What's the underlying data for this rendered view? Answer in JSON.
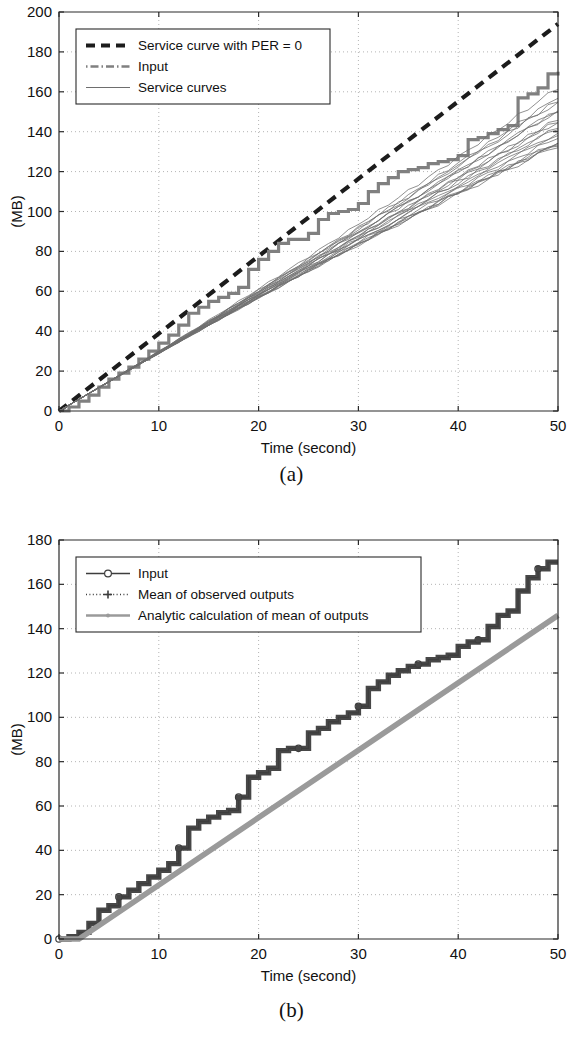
{
  "figure": {
    "caption_a": "(a)",
    "caption_b": "(b)"
  },
  "colors": {
    "axis": "#2a2a2a",
    "grid": "#b4b4b4",
    "service_curve_per0": "#1c1c1c",
    "input_gray": "#808080",
    "service_curves_bundle": "#6e6e6e",
    "input_dark": "#3d3d3d",
    "mean_observed": "#3d3d3d",
    "analytic_mean": "#9a9a9a",
    "background": "#ffffff"
  },
  "chart_data": [
    {
      "id": "panel-a",
      "type": "line",
      "title": "",
      "xlabel": "Time (second)",
      "ylabel": "(MB)",
      "xlim": [
        0,
        50
      ],
      "ylim": [
        0,
        200
      ],
      "xticks": [
        0,
        10,
        20,
        30,
        40,
        50
      ],
      "yticks": [
        0,
        20,
        40,
        60,
        80,
        100,
        120,
        140,
        160,
        180,
        200
      ],
      "grid": true,
      "legend_position": "top-left",
      "legend": [
        {
          "label": "Service curve with PER = 0",
          "style": "thick-dashed",
          "color": "#1c1c1c"
        },
        {
          "label": "Input",
          "style": "dash-dot",
          "color": "#808080"
        },
        {
          "label": "Service curves",
          "style": "thin-solid",
          "color": "#6e6e6e"
        }
      ],
      "series": [
        {
          "name": "Service curve with PER = 0",
          "style": "thick-dashed",
          "color": "#1c1c1c",
          "x": [
            0,
            50
          ],
          "y": [
            0,
            194
          ]
        },
        {
          "name": "Input",
          "style": "staircase",
          "color": "#808080",
          "x": [
            0,
            1,
            2,
            3,
            4,
            5,
            6,
            7,
            8,
            9,
            10,
            11,
            12,
            13,
            14,
            15,
            16,
            17,
            18,
            19,
            20,
            21,
            22,
            23,
            24,
            25,
            26,
            27,
            28,
            29,
            30,
            31,
            32,
            33,
            34,
            35,
            36,
            37,
            38,
            39,
            40,
            41,
            42,
            43,
            44,
            45,
            46,
            47,
            48,
            49,
            50
          ],
          "y": [
            0,
            2,
            5,
            8,
            12,
            16,
            19,
            22,
            26,
            30,
            34,
            38,
            43,
            49,
            52,
            55,
            57,
            59,
            62,
            71,
            76,
            80,
            84,
            86,
            86,
            89,
            96,
            99,
            100,
            101,
            104,
            110,
            114,
            117,
            120,
            121,
            122,
            124,
            125,
            126,
            128,
            136,
            137,
            139,
            141,
            143,
            157,
            159,
            162,
            169,
            170
          ]
        },
        {
          "name": "Service curves",
          "style": "thin-solid-bundle",
          "color": "#6e6e6e",
          "bundle_count": 20,
          "mean_slope": 2.95,
          "spread_at_end": 16,
          "x": [
            0,
            50
          ],
          "y_mean": [
            0,
            147
          ]
        }
      ]
    },
    {
      "id": "panel-b",
      "type": "line",
      "title": "",
      "xlabel": "Time (second)",
      "ylabel": "(MB)",
      "xlim": [
        0,
        50
      ],
      "ylim": [
        0,
        180
      ],
      "xticks": [
        0,
        10,
        20,
        30,
        40,
        50
      ],
      "yticks": [
        0,
        20,
        40,
        60,
        80,
        100,
        120,
        140,
        160,
        180
      ],
      "grid": true,
      "legend_position": "top-left",
      "legend": [
        {
          "label": "Input",
          "style": "line-circle",
          "color": "#3d3d3d"
        },
        {
          "label": "Mean of observed outputs",
          "style": "dotted-plus",
          "color": "#3d3d3d"
        },
        {
          "label": "Analytic calculation of mean of outputs",
          "style": "thick-solid",
          "color": "#9a9a9a"
        }
      ],
      "series": [
        {
          "name": "Input",
          "style": "staircase-markers",
          "color": "#3d3d3d",
          "marker": "circle",
          "marker_every": 6,
          "x": [
            0,
            1,
            2,
            3,
            4,
            5,
            6,
            7,
            8,
            9,
            10,
            11,
            12,
            13,
            14,
            15,
            16,
            17,
            18,
            19,
            20,
            21,
            22,
            23,
            24,
            25,
            26,
            27,
            28,
            29,
            30,
            31,
            32,
            33,
            34,
            35,
            36,
            37,
            38,
            39,
            40,
            41,
            42,
            43,
            44,
            45,
            46,
            47,
            48,
            49,
            50
          ],
          "y": [
            0,
            1,
            3,
            7,
            13,
            15,
            19,
            22,
            25,
            28,
            31,
            34,
            41,
            50,
            53,
            55,
            57,
            58,
            64,
            73,
            75,
            77,
            85,
            86,
            86,
            93,
            95,
            98,
            100,
            102,
            105,
            113,
            116,
            119,
            121,
            123,
            124,
            126,
            127,
            128,
            132,
            134,
            135,
            141,
            146,
            148,
            157,
            163,
            167,
            170,
            170
          ]
        },
        {
          "name": "Mean of observed outputs",
          "style": "staircase-dotted-markers",
          "color": "#3d3d3d",
          "marker": "plus",
          "x": [
            0,
            1,
            2,
            3,
            4,
            5,
            6,
            7,
            8,
            9,
            10,
            11,
            12,
            13,
            14,
            15,
            16,
            17,
            18,
            19,
            20,
            21,
            22,
            23,
            24,
            25,
            26,
            27,
            28,
            29,
            30,
            31,
            32,
            33,
            34,
            35,
            36,
            37,
            38,
            39,
            40,
            41,
            42,
            43,
            44,
            45,
            46,
            47,
            48,
            49,
            50
          ],
          "y": [
            0,
            1,
            3,
            7,
            13,
            15,
            19,
            22,
            25,
            28,
            31,
            34,
            41,
            50,
            53,
            55,
            57,
            58,
            64,
            73,
            75,
            77,
            85,
            86,
            86,
            93,
            95,
            98,
            100,
            102,
            105,
            113,
            116,
            119,
            121,
            123,
            124,
            126,
            127,
            128,
            132,
            134,
            135,
            141,
            146,
            148,
            157,
            163,
            167,
            170,
            170
          ]
        },
        {
          "name": "Analytic calculation of mean of outputs",
          "style": "thick-solid",
          "color": "#9a9a9a",
          "x": [
            0,
            2,
            50
          ],
          "y": [
            0,
            0,
            146
          ]
        }
      ]
    }
  ]
}
